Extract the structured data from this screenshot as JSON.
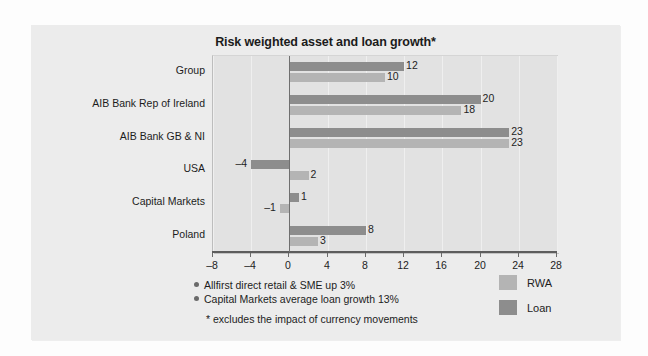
{
  "chart_data": {
    "type": "bar",
    "orientation": "horizontal",
    "title": "Risk weighted asset and loan growth*",
    "xlabel": "",
    "ylabel": "",
    "xlim": [
      -8,
      28
    ],
    "xticks": [
      -8,
      -4,
      0,
      4,
      8,
      12,
      16,
      20,
      24,
      28
    ],
    "xtick_labels": [
      "–8",
      "–4",
      "0",
      "4",
      "8",
      "12",
      "16",
      "20",
      "24",
      "28"
    ],
    "grid": true,
    "grid_axis": "x",
    "legend_position": "right-bottom",
    "categories": [
      "Group",
      "AIB Bank Rep of Ireland",
      "AIB Bank GB & NI",
      "USA",
      "Capital Markets",
      "Poland"
    ],
    "series": [
      {
        "name": "Loan",
        "color": "#8d8d8d",
        "values": [
          12,
          20,
          23,
          -4,
          1,
          8
        ],
        "value_labels": [
          "12",
          "20",
          "23",
          "–4",
          "1",
          "8"
        ]
      },
      {
        "name": "RWA",
        "color": "#b4b4b4",
        "values": [
          10,
          18,
          23,
          2,
          -1,
          3
        ],
        "value_labels": [
          "10",
          "18",
          "23",
          "2",
          "–1",
          "3"
        ]
      }
    ],
    "annotations": [
      "Allfirst direct retail & SME up 3%",
      "Capital Markets average loan growth 13%"
    ],
    "footnote": "* excludes the impact of currency movements"
  },
  "legend": {
    "items": [
      {
        "label": "RWA",
        "swatch": "rwa"
      },
      {
        "label": "Loan",
        "swatch": "loan"
      }
    ]
  },
  "colors": {
    "card_background": "#ececec",
    "plot_background": "#e2e2e2",
    "gridline": "#efefef",
    "axis": "#5d5d5d",
    "loan_bar": "#8d8d8d",
    "rwa_bar": "#b4b4b4",
    "text": "#1c1c1c"
  }
}
